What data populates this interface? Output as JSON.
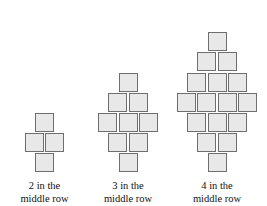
{
  "figure": {
    "background_color": "#ffffff",
    "square_fill_color": "#e8e8e8",
    "square_border_color": "#6e6e6e",
    "caption_color": "#111111"
  },
  "groups": [
    {
      "id": "group-1",
      "middle_row_count": 2,
      "total_squares": 4,
      "rows": [
        1,
        2,
        1
      ],
      "caption_line_1": "2 in the",
      "caption_line_2": "middle row"
    },
    {
      "id": "group-2",
      "middle_row_count": 3,
      "total_squares": 9,
      "rows": [
        1,
        2,
        3,
        2,
        1
      ],
      "caption_line_1": "3 in the",
      "caption_line_2": "middle row"
    },
    {
      "id": "group-3",
      "middle_row_count": 4,
      "total_squares": 16,
      "rows": [
        1,
        2,
        3,
        4,
        3,
        2,
        1
      ],
      "caption_line_1": "4 in the",
      "caption_line_2": "middle row"
    }
  ]
}
